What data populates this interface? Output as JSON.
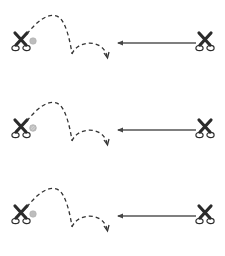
{
  "diagram": {
    "colors": {
      "background": "#ffffff",
      "stroke": "#333333",
      "ball_fill": "#bdbdbd",
      "arrow_line": "#555555"
    },
    "rows": [
      {
        "index": 1,
        "top": 0,
        "ball_style": "solid-grey"
      },
      {
        "index": 2,
        "top": 87,
        "ball_style": "hatched-grey"
      },
      {
        "index": 3,
        "top": 173,
        "ball_style": "solid-grey"
      }
    ],
    "icons": {
      "left": "scissors-icon",
      "ball": "ball-icon",
      "trajectory": "dashed-bounce-arrow",
      "arrow": "left-arrow",
      "right": "scissors-icon"
    }
  }
}
